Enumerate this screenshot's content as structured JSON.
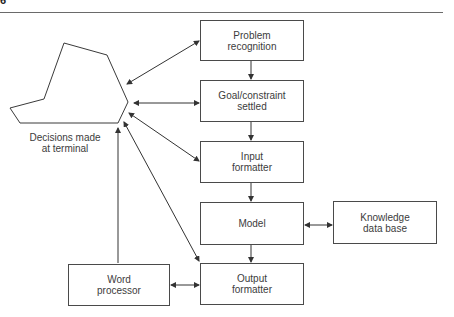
{
  "page": {
    "number_fragment": "6"
  },
  "terminal": {
    "label": "Decisions made\nat terminal"
  },
  "nodes": {
    "problem_recognition": "Problem\nrecognition",
    "goal_constraint": "Goal/constraint\nsettled",
    "input_formatter": "Input\nformatter",
    "model": "Model",
    "output_formatter": "Output\nformatter",
    "knowledge_base": "Knowledge\ndata base",
    "word_processor": "Word\nprocessor"
  },
  "edges": [
    {
      "from": "problem_recognition",
      "to": "terminal",
      "bidirectional": true
    },
    {
      "from": "goal_constraint",
      "to": "terminal",
      "bidirectional": true
    },
    {
      "from": "input_formatter",
      "to": "terminal",
      "bidirectional": true
    },
    {
      "from": "output_formatter",
      "to": "terminal",
      "bidirectional": true
    },
    {
      "from": "word_processor",
      "to": "terminal",
      "bidirectional": false
    },
    {
      "from": "problem_recognition",
      "to": "goal_constraint",
      "bidirectional": false
    },
    {
      "from": "goal_constraint",
      "to": "input_formatter",
      "bidirectional": false
    },
    {
      "from": "input_formatter",
      "to": "model",
      "bidirectional": false
    },
    {
      "from": "model",
      "to": "output_formatter",
      "bidirectional": false
    },
    {
      "from": "model",
      "to": "knowledge_base",
      "bidirectional": true
    },
    {
      "from": "word_processor",
      "to": "output_formatter",
      "bidirectional": true
    }
  ]
}
